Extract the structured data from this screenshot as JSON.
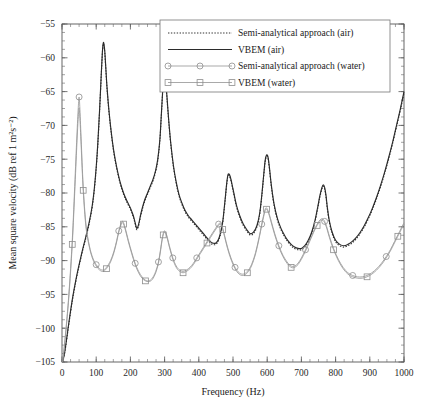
{
  "chart_data": {
    "type": "line",
    "title": "",
    "xlabel": "Frequency (Hz)",
    "ylabel": "Mean square velocity (dB ref 1 m²s⁻²)",
    "xlim": [
      0,
      1000
    ],
    "ylim": [
      -105,
      -55
    ],
    "grid": false,
    "legend_position": "top-center",
    "x_ticks": [
      0,
      100,
      200,
      300,
      400,
      500,
      600,
      700,
      800,
      900,
      1000
    ],
    "x_tick_labels": [
      "0",
      "100",
      "200",
      "300",
      "400",
      "500",
      "600",
      "700",
      "800",
      "900",
      "1000"
    ],
    "x_minor_step": 25,
    "y_ticks": [
      -105,
      -100,
      -95,
      -90,
      -85,
      -80,
      -75,
      -70,
      -65,
      -60,
      -55
    ],
    "y_tick_labels": [
      "−105",
      "−100",
      "−95",
      "−90",
      "−85",
      "−80",
      "−75",
      "−70",
      "−65",
      "−60",
      "−55"
    ],
    "y_minor_step": 1.25,
    "series": [
      {
        "name": "Semi-analytical approach (air)",
        "style": "dotted",
        "color": "#333333",
        "marker": "none",
        "x": [
          2,
          8,
          14,
          20,
          30,
          40,
          50,
          60,
          70,
          80,
          88,
          94,
          100,
          105,
          110,
          115,
          118,
          120,
          122,
          125,
          128,
          132,
          138,
          145,
          152,
          160,
          170,
          180,
          190,
          200,
          206,
          210,
          214,
          218,
          222,
          226,
          230,
          236,
          242,
          250,
          258,
          266,
          274,
          280,
          286,
          290,
          294,
          297,
          300,
          303,
          307,
          312,
          318,
          326,
          334,
          342,
          350,
          360,
          370,
          380,
          390,
          400,
          410,
          420,
          430,
          440,
          450,
          458,
          464,
          470,
          474,
          478,
          482,
          486,
          492,
          500,
          510,
          520,
          530,
          540,
          550,
          560,
          570,
          578,
          584,
          590,
          594,
          598,
          602,
          606,
          612,
          620,
          630,
          640,
          650,
          660,
          670,
          680,
          690,
          700,
          710,
          720,
          730,
          740,
          748,
          754,
          760,
          764,
          768,
          772,
          776,
          782,
          790,
          800,
          812,
          824,
          836,
          848,
          860,
          872,
          884,
          896,
          908,
          920,
          932,
          944,
          956,
          968,
          980,
          990,
          1000
        ],
        "y": [
          -105.0,
          -103.6,
          -101.6,
          -99.4,
          -96.0,
          -93.2,
          -90.8,
          -88.6,
          -86.6,
          -84.4,
          -82.2,
          -79.8,
          -76.4,
          -72.6,
          -67.8,
          -62.4,
          -59.4,
          -58.2,
          -58.0,
          -59.2,
          -61.6,
          -64.8,
          -68.4,
          -71.6,
          -74.2,
          -76.4,
          -78.6,
          -80.2,
          -81.4,
          -82.4,
          -83.2,
          -83.8,
          -84.6,
          -85.4,
          -85.2,
          -84.4,
          -83.4,
          -82.2,
          -81.2,
          -80.2,
          -79.2,
          -78.2,
          -76.8,
          -75.2,
          -72.4,
          -69.0,
          -65.4,
          -63.4,
          -62.8,
          -63.6,
          -66.0,
          -69.4,
          -72.8,
          -76.2,
          -78.6,
          -80.4,
          -81.6,
          -82.8,
          -83.6,
          -84.2,
          -84.8,
          -85.4,
          -86.0,
          -86.6,
          -87.2,
          -87.6,
          -87.6,
          -87.0,
          -86.0,
          -84.4,
          -82.6,
          -80.6,
          -78.6,
          -77.4,
          -77.8,
          -79.6,
          -82.0,
          -83.6,
          -84.8,
          -85.6,
          -86.2,
          -86.0,
          -85.0,
          -83.2,
          -80.6,
          -77.4,
          -75.4,
          -74.6,
          -74.8,
          -76.2,
          -79.0,
          -81.8,
          -84.0,
          -85.4,
          -86.4,
          -87.2,
          -87.8,
          -88.2,
          -88.4,
          -88.4,
          -88.0,
          -87.2,
          -86.0,
          -84.2,
          -82.2,
          -80.6,
          -79.4,
          -79.0,
          -79.4,
          -80.6,
          -82.4,
          -84.4,
          -86.0,
          -87.2,
          -87.8,
          -88.0,
          -87.8,
          -87.4,
          -86.8,
          -86.0,
          -85.0,
          -83.8,
          -82.4,
          -80.8,
          -79.0,
          -77.0,
          -74.8,
          -72.4,
          -69.8,
          -67.6,
          -65.2
        ]
      },
      {
        "name": "VBEM (air)",
        "style": "solid",
        "color": "#2b2b2b",
        "marker": "none",
        "x": [
          2,
          8,
          14,
          20,
          30,
          40,
          50,
          60,
          70,
          80,
          88,
          94,
          100,
          105,
          110,
          115,
          118,
          120,
          122,
          125,
          128,
          132,
          138,
          145,
          152,
          160,
          170,
          180,
          190,
          200,
          206,
          210,
          214,
          218,
          222,
          226,
          230,
          236,
          242,
          250,
          258,
          266,
          274,
          280,
          286,
          290,
          294,
          297,
          300,
          303,
          307,
          312,
          318,
          326,
          334,
          342,
          350,
          360,
          370,
          380,
          390,
          400,
          410,
          420,
          430,
          440,
          450,
          458,
          464,
          470,
          474,
          478,
          482,
          486,
          492,
          500,
          510,
          520,
          530,
          540,
          550,
          560,
          570,
          578,
          584,
          590,
          594,
          598,
          602,
          606,
          612,
          620,
          630,
          640,
          650,
          660,
          670,
          680,
          690,
          700,
          710,
          720,
          730,
          740,
          748,
          754,
          760,
          764,
          768,
          772,
          776,
          782,
          790,
          800,
          812,
          824,
          836,
          848,
          860,
          872,
          884,
          896,
          908,
          920,
          932,
          944,
          956,
          968,
          980,
          990,
          1000
        ],
        "y": [
          -105.0,
          -103.5,
          -101.4,
          -99.2,
          -95.8,
          -93.0,
          -90.6,
          -88.4,
          -86.4,
          -84.2,
          -82.0,
          -79.6,
          -76.2,
          -72.4,
          -67.6,
          -62.2,
          -59.2,
          -58.0,
          -57.8,
          -59.0,
          -61.4,
          -64.6,
          -68.2,
          -71.4,
          -74.0,
          -76.2,
          -78.4,
          -80.0,
          -81.2,
          -82.2,
          -83.0,
          -83.6,
          -84.4,
          -85.2,
          -85.0,
          -84.2,
          -83.2,
          -82.0,
          -81.0,
          -80.0,
          -79.0,
          -78.0,
          -76.6,
          -75.0,
          -72.2,
          -68.8,
          -65.2,
          -63.2,
          -62.6,
          -63.4,
          -65.8,
          -69.2,
          -72.6,
          -76.0,
          -78.4,
          -80.2,
          -81.4,
          -82.6,
          -83.4,
          -84.0,
          -84.6,
          -85.2,
          -85.8,
          -86.4,
          -87.0,
          -87.4,
          -87.4,
          -86.8,
          -85.8,
          -84.2,
          -82.4,
          -80.4,
          -78.4,
          -77.2,
          -77.6,
          -79.4,
          -81.8,
          -83.4,
          -84.6,
          -85.4,
          -86.0,
          -85.8,
          -84.8,
          -83.0,
          -80.4,
          -77.2,
          -75.2,
          -74.4,
          -74.6,
          -76.0,
          -78.8,
          -81.6,
          -83.8,
          -85.2,
          -86.2,
          -87.0,
          -87.6,
          -88.0,
          -88.2,
          -88.2,
          -87.8,
          -87.0,
          -85.8,
          -84.0,
          -82.0,
          -80.4,
          -79.2,
          -78.8,
          -79.2,
          -80.4,
          -82.2,
          -84.2,
          -85.8,
          -87.0,
          -87.6,
          -87.8,
          -87.6,
          -87.2,
          -86.6,
          -85.8,
          -84.8,
          -83.6,
          -82.2,
          -80.6,
          -78.8,
          -76.8,
          -74.6,
          -72.2,
          -69.6,
          -67.4,
          -65.0
        ]
      },
      {
        "name": "Semi-analytical approach (water)",
        "style": "solid-marker",
        "color": "#9a9a9a",
        "marker": "circle",
        "x": [
          2,
          10,
          20,
          30,
          38,
          44,
          48,
          50,
          52,
          56,
          62,
          70,
          80,
          90,
          100,
          110,
          120,
          130,
          142,
          152,
          160,
          166,
          172,
          176,
          180,
          186,
          194,
          204,
          214,
          224,
          234,
          244,
          254,
          264,
          274,
          282,
          288,
          292,
          296,
          300,
          306,
          314,
          324,
          334,
          344,
          354,
          364,
          374,
          384,
          394,
          404,
          414,
          424,
          434,
          444,
          452,
          458,
          462,
          466,
          470,
          476,
          484,
          494,
          506,
          518,
          530,
          542,
          554,
          566,
          576,
          584,
          590,
          594,
          598,
          604,
          612,
          622,
          634,
          646,
          658,
          670,
          680,
          690,
          700,
          712,
          724,
          736,
          746,
          754,
          760,
          764,
          768,
          774,
          782,
          794,
          808,
          822,
          836,
          850,
          864,
          878,
          892,
          906,
          920,
          934,
          948,
          960,
          972,
          982,
          992,
          1000
        ],
        "y": [
          -105.0,
          -101.0,
          -95.0,
          -87.0,
          -78.0,
          -71.0,
          -67.0,
          -65.8,
          -67.2,
          -72.0,
          -79.0,
          -84.6,
          -87.8,
          -89.6,
          -90.6,
          -91.2,
          -91.4,
          -91.0,
          -90.0,
          -88.6,
          -87.0,
          -85.6,
          -84.6,
          -84.2,
          -84.4,
          -85.4,
          -87.0,
          -88.8,
          -90.4,
          -91.6,
          -92.4,
          -92.9,
          -93.0,
          -92.6,
          -91.6,
          -90.2,
          -88.4,
          -87.0,
          -86.0,
          -85.6,
          -86.2,
          -87.8,
          -89.6,
          -90.8,
          -91.4,
          -91.6,
          -91.4,
          -91.0,
          -90.4,
          -89.6,
          -88.8,
          -88.0,
          -87.2,
          -86.4,
          -85.6,
          -85.0,
          -84.6,
          -84.4,
          -84.6,
          -85.2,
          -86.4,
          -88.0,
          -89.6,
          -91.0,
          -91.8,
          -92.0,
          -91.6,
          -90.6,
          -88.8,
          -86.6,
          -84.6,
          -83.2,
          -82.4,
          -82.2,
          -82.8,
          -84.2,
          -86.0,
          -87.8,
          -89.2,
          -90.2,
          -90.8,
          -90.8,
          -90.4,
          -89.6,
          -88.4,
          -87.0,
          -85.6,
          -84.6,
          -84.0,
          -83.8,
          -83.9,
          -84.2,
          -85.0,
          -86.4,
          -88.2,
          -89.8,
          -91.0,
          -91.8,
          -92.2,
          -92.4,
          -92.4,
          -92.2,
          -91.8,
          -91.2,
          -90.4,
          -89.4,
          -88.4,
          -87.2,
          -86.2,
          -85.2,
          -84.4
        ]
      },
      {
        "name": "VBEM (water)",
        "style": "solid-marker",
        "color": "#9a9a9a",
        "marker": "square",
        "x": [
          2,
          10,
          20,
          30,
          38,
          44,
          48,
          50,
          52,
          56,
          62,
          70,
          80,
          90,
          100,
          110,
          120,
          130,
          142,
          152,
          160,
          166,
          172,
          176,
          180,
          186,
          194,
          204,
          214,
          224,
          234,
          244,
          254,
          264,
          274,
          282,
          288,
          292,
          296,
          300,
          306,
          314,
          324,
          334,
          344,
          354,
          364,
          374,
          384,
          394,
          404,
          414,
          424,
          434,
          444,
          452,
          458,
          462,
          466,
          470,
          476,
          484,
          494,
          506,
          518,
          530,
          542,
          554,
          566,
          576,
          584,
          590,
          594,
          598,
          604,
          612,
          622,
          634,
          646,
          658,
          670,
          680,
          690,
          700,
          712,
          724,
          736,
          746,
          754,
          760,
          764,
          768,
          774,
          782,
          794,
          808,
          822,
          836,
          850,
          864,
          878,
          892,
          906,
          920,
          934,
          948,
          960,
          972,
          982,
          992,
          1000
        ],
        "y": [
          -105.0,
          -101.2,
          -95.4,
          -87.6,
          -79.0,
          -72.2,
          -68.4,
          -67.4,
          -68.6,
          -73.0,
          -79.6,
          -85.0,
          -88.0,
          -89.8,
          -90.8,
          -91.4,
          -91.6,
          -91.2,
          -90.2,
          -88.8,
          -87.2,
          -85.8,
          -84.8,
          -84.4,
          -84.6,
          -85.6,
          -87.2,
          -89.0,
          -90.6,
          -91.8,
          -92.6,
          -93.0,
          -93.1,
          -92.8,
          -91.8,
          -90.4,
          -88.6,
          -87.2,
          -86.2,
          -85.8,
          -86.4,
          -88.0,
          -89.8,
          -91.0,
          -91.6,
          -91.8,
          -91.6,
          -91.2,
          -90.6,
          -89.8,
          -89.0,
          -88.2,
          -87.4,
          -86.6,
          -85.8,
          -85.2,
          -84.8,
          -84.6,
          -84.8,
          -85.4,
          -86.6,
          -88.2,
          -89.8,
          -91.2,
          -92.0,
          -92.2,
          -91.8,
          -90.8,
          -89.0,
          -86.8,
          -84.8,
          -83.4,
          -82.6,
          -82.4,
          -83.0,
          -84.4,
          -86.2,
          -88.0,
          -89.4,
          -90.4,
          -91.0,
          -91.0,
          -90.6,
          -89.8,
          -88.6,
          -87.2,
          -85.8,
          -84.8,
          -84.2,
          -84.0,
          -84.1,
          -84.4,
          -85.2,
          -86.6,
          -88.4,
          -90.0,
          -91.2,
          -92.0,
          -92.4,
          -92.6,
          -92.6,
          -92.4,
          -92.0,
          -91.4,
          -90.6,
          -89.6,
          -88.6,
          -87.4,
          -86.4,
          -85.4,
          -84.6
        ]
      }
    ]
  },
  "legend": {
    "items": [
      {
        "label": "Semi-analytical approach (air)",
        "style": "dotted",
        "marker": "none"
      },
      {
        "label": "VBEM (air)",
        "style": "solid",
        "marker": "none"
      },
      {
        "label": "Semi-analytical approach (water)",
        "style": "solid-marker",
        "marker": "circle"
      },
      {
        "label": "VBEM (water)",
        "style": "solid-marker",
        "marker": "square"
      }
    ]
  }
}
